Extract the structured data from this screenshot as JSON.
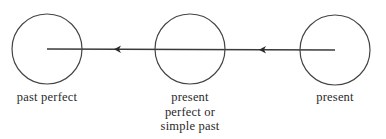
{
  "diagram": {
    "type": "tense-timeline",
    "direction": "right-to-left",
    "colors": {
      "stroke": "#3a3a3a",
      "text": "#2a2a2a",
      "background": "#ffffff"
    },
    "nodes": [
      {
        "id": "past-perfect",
        "label_lines": [
          "past perfect"
        ],
        "cx": 47,
        "cy": 49,
        "r": 35
      },
      {
        "id": "present-perfect-or-simple-past",
        "label_lines": [
          "present",
          "perfect or",
          "simple past"
        ],
        "cx": 190,
        "cy": 49,
        "r": 35
      },
      {
        "id": "present",
        "label_lines": [
          "present"
        ],
        "cx": 335,
        "cy": 50,
        "r": 35
      }
    ],
    "edges": [
      {
        "from": "present",
        "to": "present-perfect-or-simple-past",
        "arrowhead_x": 262
      },
      {
        "from": "present-perfect-or-simple-past",
        "to": "past-perfect",
        "arrowhead_x": 117
      }
    ],
    "timeline": {
      "x_start": 335,
      "x_end": 47,
      "y": 49
    }
  }
}
